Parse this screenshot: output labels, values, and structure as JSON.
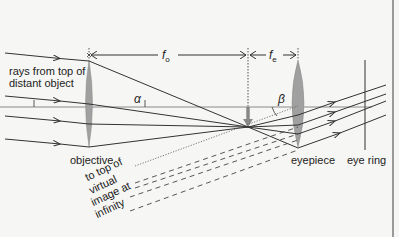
{
  "diagram": {
    "type": "optics-ray-diagram",
    "labels": {
      "incoming_rays": "rays from top of distant object",
      "incoming_rays_line1": "rays from top of",
      "incoming_rays_line2": "distant object",
      "objective": "objective",
      "eyepiece": "eyepiece",
      "eye_ring": "eye ring",
      "virtual_image_line1": "to top of",
      "virtual_image_line2": "virtual",
      "virtual_image_line3": "image at",
      "virtual_image_line4": "infinity"
    },
    "dimensions": {
      "objective_focal_length": {
        "symbol": "f",
        "subscript": "o"
      },
      "eyepiece_focal_length": {
        "symbol": "f",
        "subscript": "e"
      }
    },
    "angles": {
      "alpha": "α",
      "beta": "β"
    },
    "colors": {
      "lens_fill": "#9a9a9a",
      "ray_line": "#333333",
      "axis_line": "#777777",
      "background": "#f6f6f4"
    }
  }
}
